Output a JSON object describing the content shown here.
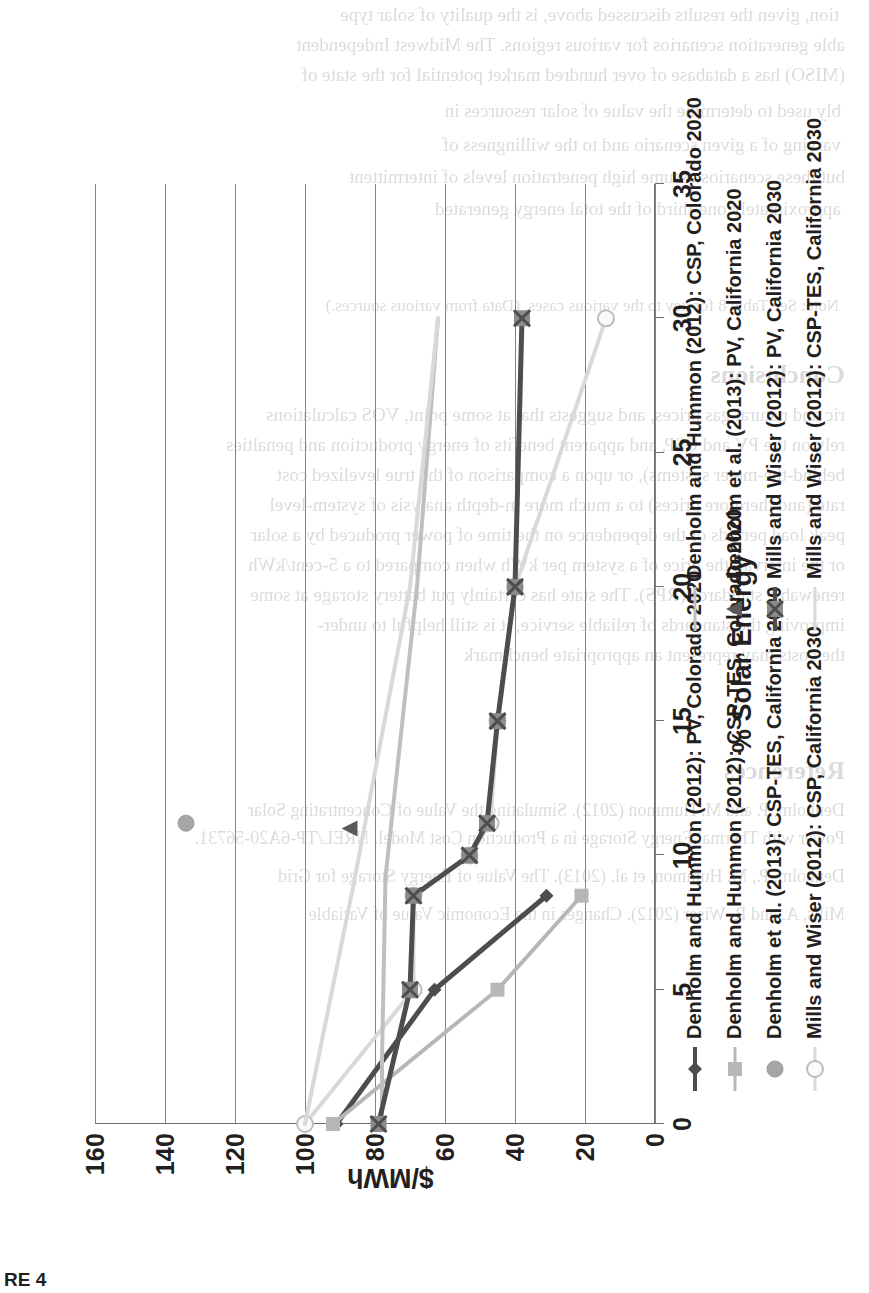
{
  "caption": "RE 4",
  "chart_data": {
    "type": "line",
    "title": "",
    "xlabel": "% Solar Energy",
    "ylabel": "$/MWh",
    "xlim": [
      0,
      35
    ],
    "ylim": [
      0,
      160
    ],
    "xticks": [
      0,
      5,
      10,
      15,
      20,
      25,
      30,
      35
    ],
    "yticks": [
      0,
      20,
      40,
      60,
      80,
      100,
      120,
      140,
      160
    ],
    "grid": "horizontal-gridlines-only",
    "legend_position": "below-plot-two-columns",
    "series": [
      {
        "name": "Denholm and Hummon (2012): PV, Colorado 2020",
        "color": "#4d4d4d",
        "marker": "diamond",
        "line": "solid",
        "points": [
          [
            0,
            91
          ],
          [
            5,
            63
          ],
          [
            8.5,
            31
          ]
        ]
      },
      {
        "name": "Denholm and Hummon (2012): CSP-TES, Colorado 2020",
        "color": "#b7b7b7",
        "marker": "square",
        "line": "solid",
        "points": [
          [
            0,
            92
          ],
          [
            5,
            45
          ],
          [
            8.5,
            21
          ]
        ]
      },
      {
        "name": "Denholm et al. (2013): CSP-TES, California 2020",
        "color": "#a6a6a6",
        "marker": "circle",
        "line": "none",
        "points": [
          [
            11.2,
            134
          ]
        ]
      },
      {
        "name": "Mills and Wiser (2012): CSP, California 2030",
        "color": "#d9d9d9",
        "marker": "circle-open",
        "line": "solid",
        "points": [
          [
            0,
            100
          ],
          [
            5,
            69
          ],
          [
            8.5,
            69
          ],
          [
            10,
            53
          ],
          [
            11.2,
            47
          ],
          [
            15,
            45
          ],
          [
            20,
            40
          ],
          [
            30,
            14
          ]
        ]
      },
      {
        "name": "Denholm and Hummon (2012): CSP, Colorado 2020",
        "color": "#bfbfbf",
        "marker": "none",
        "line": "solid",
        "points": [
          [
            0,
            78
          ],
          [
            2.4,
            78
          ],
          [
            9.2,
            77
          ],
          [
            20,
            68
          ],
          [
            30,
            62
          ]
        ]
      },
      {
        "name": "Denholm et al. (2013): PV, California 2020",
        "color": "#595959",
        "marker": "triangle",
        "line": "none",
        "points": [
          [
            11.0,
            87
          ]
        ]
      },
      {
        "name": "Mills and Wiser (2012): PV, California 2030",
        "color": "#4d4d4d",
        "marker": "square-x",
        "line": "solid",
        "points": [
          [
            0,
            79
          ],
          [
            5,
            70
          ],
          [
            8.5,
            69
          ],
          [
            10,
            53
          ],
          [
            11.2,
            48
          ],
          [
            15,
            45
          ],
          [
            20,
            40
          ],
          [
            30,
            38
          ]
        ]
      },
      {
        "name": "Mills and Wiser (2012): CSP-TES, California 2030",
        "color": "#d9d9d9",
        "marker": "none",
        "line": "solid",
        "points": [
          [
            0,
            100
          ],
          [
            9.0,
            86
          ],
          [
            20,
            70
          ],
          [
            30,
            62
          ]
        ]
      }
    ],
    "legend_order": [
      "Denholm and Hummon (2012): PV, Colorado 2020",
      "Denholm and Hummon (2012): CSP-TES, Colorado 2020",
      "Denholm et al. (2013): CSP-TES, California 2020",
      "Mills and Wiser (2012): CSP, California 2030",
      "Denholm and Hummon (2012): CSP, Colorado 2020",
      "Denholm et al. (2013): PV, California 2020",
      "Mills and Wiser (2012): PV, California 2030",
      "Mills and Wiser (2012): CSP-TES, California 2030"
    ]
  },
  "legend": {
    "column_left": [
      {
        "label": "Denholm and Hummon (2012): PV, Colorado 2020",
        "color": "#4d4d4d",
        "marker": "diamond",
        "line": "solid"
      },
      {
        "label": "Denholm and Hummon (2012): CSP-TES, Colorado 2020",
        "color": "#b7b7b7",
        "marker": "square",
        "line": "solid"
      },
      {
        "label": "Denholm et al. (2013): CSP-TES, California 2020",
        "color": "#a6a6a6",
        "marker": "circle",
        "line": "none"
      },
      {
        "label": "Mills and Wiser (2012): CSP, California 2030",
        "color": "#d9d9d9",
        "marker": "circle-open",
        "line": "solid"
      }
    ],
    "column_right": [
      {
        "label": "Denholm and Hummon (2012): CSP, Colorado 2020",
        "color": "#bfbfbf",
        "marker": "none",
        "line": "solid"
      },
      {
        "label": "Denholm et al. (2013): PV, California 2020",
        "color": "#595959",
        "marker": "triangle",
        "line": "none"
      },
      {
        "label": "Mills and Wiser (2012): PV, California 2030",
        "color": "#4d4d4d",
        "marker": "square-x",
        "line": "solid"
      },
      {
        "label": "Mills and Wiser (2012): CSP-TES, California 2030",
        "color": "#d9d9d9",
        "marker": "none",
        "line": "solid"
      }
    ]
  },
  "bleed_through_text": [
    "tion, given the results discussed above, is the quality of solar type",
    "able generation scenarios for various regions. The Midwest Independent",
    "(MISO) has a database of over hundred market potential for the state of",
    "bly used to determine the value of solar resources in",
    "varying of a given scenario and to the willingness of",
    "but these scenarios assume high penetration levels of intermittent",
    "approximately one-third of the total energy generated",
    "Note: See Table 8 for key to the various cases. (Data from various sources.)",
    "Conclusions",
    "ric and natural gas prices, and suggests that at some point, VOS calculations",
    "rely on the PV and CSP, and apparent benefits of energy production and penalties",
    "behind-the-meter systems), or upon a comparison of the true levelized cost",
    "rate (and therefore prices) to a much more in-depth analysis of system-level",
    "peak load periods or the dependence on the time of power produced by a solar",
    "or the interval, the price of a system per kWh when compared to a 5-cent/kWh",
    "renewable standards (RPS). The state has certainly put battery storage at some",
    "improving the standards of reliable service, it is still helpful to under-",
    "the costs may represent an appropriate benchmark",
    "References",
    "Denholm, P. and M. Hummon (2012). Simulating the Value of Concentrating Solar",
    "Power with Thermal Energy Storage in a Production Cost Model. NREL/TP-6A20-56731.",
    "Denholm, P., M. Hummon, et al. (2013). The Value of Energy Storage for Grid",
    "Mills, A. and R. Wiser (2012). Changes in the Economic Value of Variable"
  ]
}
